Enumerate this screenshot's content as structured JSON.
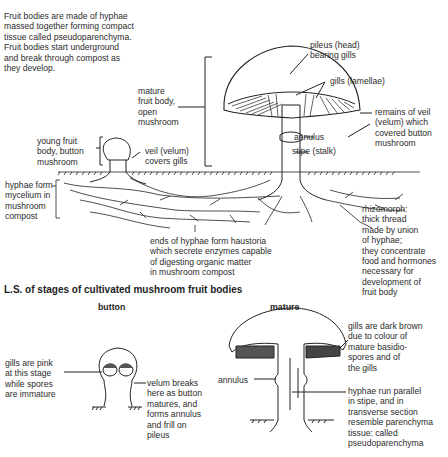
{
  "intro": {
    "text": "Fruit bodies are made of hyphae\nmassed together forming compact\ntissue called pseudoparenchyma.\nFruit bodies start underground\nand break through compost as\nthey develop."
  },
  "upper_diagram": {
    "labels": {
      "mature_fruit_body": "mature\nfruit body,\nopen\nmushroom",
      "pileus": "pileus (head)\nbearing gills",
      "gills": "gills (lamellae)",
      "veil_remains": "remains of veil\n(velum) which\ncovered button\nmushroom",
      "annulus": "annulus",
      "stipe": "stipe (stalk)",
      "young_fruit_body": "young fruit\nbody, button\nmushroom",
      "veil": "veil (velum)\ncovers gills",
      "hyphae_mycelium": "hyphae form\nmycelium in\nmushroom\ncompost",
      "haustoria": "ends of hyphae form haustoria\nwhich secrete enzymes capable\nof digesting organic matter\nin mushroom compost",
      "rhizomorph": "rhizomorph:\nthick thread\nmade by union\nof hyphae;\nthey concentrate\nfood and hormones\nnecessary for\ndevelopment of\nfruit body"
    }
  },
  "lower_section": {
    "title": "L.S. of stages of cultivated mushroom fruit bodies",
    "button": {
      "heading": "button",
      "gills_label": "gills are pink\nat this stage\nwhile spores\nare immature",
      "velum_label": "velum breaks\nhere as button\nmatures, and\nforms annulus\nand frill on\npileus"
    },
    "mature": {
      "heading": "mature",
      "annulus_label": "annulus",
      "gills_label": "gills are dark brown\ndue to colour of\nmature basidio-\nspores and of\nthe gills",
      "hyphae_label": "hyphae run parallel\nin stipe, and in\ntransverse section\nresemble parenchyma\ntissue: called\npseudoparenchyma"
    }
  }
}
